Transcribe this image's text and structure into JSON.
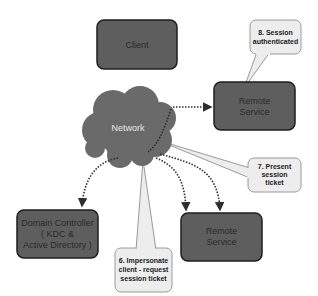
{
  "diagram": {
    "nodes": {
      "client": {
        "label": "Client"
      },
      "network": {
        "label": "Network"
      },
      "remote_service_top": {
        "line1": "Remote",
        "line2": "Service"
      },
      "remote_service_bottom": {
        "line1": "Remote",
        "line2": "Service"
      },
      "domain_controller": {
        "line1": "Domain Controller",
        "line2": "( KDC &",
        "line3": "Active Directory )"
      }
    },
    "callouts": {
      "step6": {
        "line1": "6. Impersonate",
        "line2": "client - request",
        "line3": "session ticket"
      },
      "step7": {
        "line1": "7. Present",
        "line2": "session",
        "line3": "ticket"
      },
      "step8": {
        "line1": "8. Session",
        "line2": "authenticated"
      }
    },
    "edges": [
      {
        "from": "network",
        "to": "remote_service_top",
        "style": "dotted-arrow"
      },
      {
        "from": "network",
        "to": "domain_controller",
        "style": "dotted-arrow"
      },
      {
        "from": "network",
        "to": "remote_service_bottom",
        "style": "dotted-arrow"
      },
      {
        "from": "network",
        "to": "remote_service_bottom",
        "style": "dotted-arrow"
      }
    ],
    "colors": {
      "box_fill": "#5e5e5e",
      "box_stroke": "#1e1e1e",
      "cloud_fill": "#6a6a6a",
      "callout_fill": "#ededed",
      "callout_stroke": "#9a9a9a",
      "edge": "#2e2e2e"
    }
  }
}
